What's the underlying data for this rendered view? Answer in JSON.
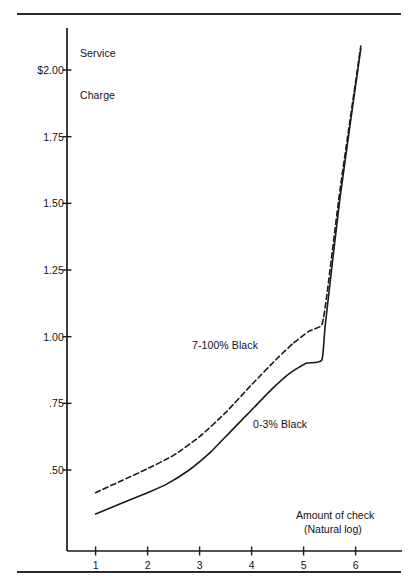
{
  "chart_data": {
    "type": "line",
    "title": "",
    "ylabel": "Service Charge",
    "ylabel_lines": [
      "Service",
      "Charge"
    ],
    "xlabel": "Amount of check (Natural log)",
    "xlabel_lines": [
      "Amount of check",
      "(Natural log)"
    ],
    "grid": false,
    "legend_position": "inline-annotations",
    "xlim": [
      0.45,
      6.35
    ],
    "ylim": [
      0.215,
      2.17
    ],
    "x_ticks": [
      1,
      2,
      3,
      4,
      5,
      6
    ],
    "x_tick_labels": [
      "1",
      "2",
      "3",
      "4",
      "5",
      "6"
    ],
    "y_ticks": [
      2.0,
      1.75,
      1.5,
      1.25,
      1.0,
      0.75,
      0.5
    ],
    "y_tick_labels": [
      "$2.00",
      "1.75",
      "1.50",
      "1.25",
      "1.00",
      ".75",
      ".50"
    ],
    "series": [
      {
        "name": "7-100% Black",
        "style": "dashed",
        "color": "#1a1a1a",
        "label_text": "7-100% Black",
        "x": [
          1.0,
          1.5,
          2.0,
          2.5,
          3.0,
          3.5,
          4.0,
          4.5,
          4.8,
          5.1,
          5.35,
          5.45,
          5.7,
          6.1
        ],
        "y": [
          0.415,
          0.46,
          0.505,
          0.555,
          0.625,
          0.715,
          0.82,
          0.92,
          0.975,
          1.02,
          1.045,
          1.16,
          1.55,
          2.09
        ]
      },
      {
        "name": "0-3% Black",
        "style": "solid",
        "color": "#1a1a1a",
        "label_text": "0-3% Black",
        "x": [
          1.0,
          1.5,
          2.0,
          2.35,
          2.8,
          3.2,
          3.6,
          4.0,
          4.4,
          4.75,
          5.05,
          5.35,
          5.42,
          5.7,
          6.1
        ],
        "y": [
          0.335,
          0.375,
          0.415,
          0.445,
          0.5,
          0.565,
          0.645,
          0.725,
          0.805,
          0.865,
          0.9,
          0.912,
          1.05,
          1.52,
          2.08
        ]
      }
    ]
  },
  "axes": {
    "y_axis_label_line1": "Service",
    "y_axis_label_line2": "Charge",
    "x_axis_caption_line1": "Amount of check",
    "x_axis_caption_line2": "(Natural log)"
  },
  "style": {
    "ink": "#1a1a1a",
    "rule_color": "#2a2a2a",
    "background": "#ffffff"
  }
}
